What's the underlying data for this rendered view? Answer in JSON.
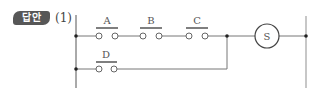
{
  "header": {
    "badge_label": "답안",
    "question_number": "(1)"
  },
  "diagram": {
    "type": "ladder-relay-circuit",
    "colors": {
      "wire": "#777777",
      "rail_right": "#b5b5b5",
      "dot": "#222222",
      "badge_bg": "#575757"
    },
    "contacts": [
      {
        "id": "A",
        "label": "A",
        "type": "normally-open",
        "rung": 1
      },
      {
        "id": "B",
        "label": "B",
        "type": "normally-open",
        "rung": 1
      },
      {
        "id": "C",
        "label": "C",
        "type": "normally-open",
        "rung": 1
      },
      {
        "id": "D",
        "label": "D",
        "type": "normally-open",
        "rung": 2,
        "parallel_to": [
          "A",
          "B",
          "C"
        ]
      }
    ],
    "output": {
      "id": "S",
      "label": "S",
      "type": "coil"
    },
    "logic": "S = (A · B · C) + D"
  }
}
